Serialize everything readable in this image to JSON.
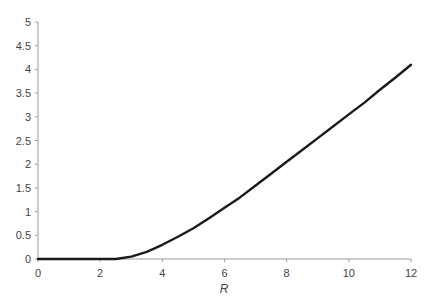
{
  "chart_data": {
    "type": "line",
    "title": "",
    "xlabel": "R",
    "ylabel": "",
    "xlim": [
      0,
      12
    ],
    "ylim": [
      0,
      5
    ],
    "grid": false,
    "legend": null,
    "x_ticks": [
      "0",
      "2",
      "4",
      "6",
      "8",
      "10",
      "12"
    ],
    "y_ticks": [
      "0",
      "0.5",
      "1",
      "1.5",
      "2",
      "2.5",
      "3",
      "3.5",
      "4",
      "4.5",
      "5"
    ],
    "series": [
      {
        "name": "curve",
        "color": "#1a1a1a",
        "x": [
          0,
          1,
          2,
          2.5,
          3,
          3.5,
          4,
          4.5,
          5,
          5.5,
          6,
          6.5,
          7,
          7.5,
          8,
          8.5,
          9,
          9.5,
          10,
          10.5,
          11,
          11.5,
          12
        ],
        "y": [
          0,
          0,
          0,
          0.0,
          0.05,
          0.15,
          0.3,
          0.47,
          0.65,
          0.86,
          1.08,
          1.3,
          1.55,
          1.8,
          2.05,
          2.3,
          2.55,
          2.8,
          3.05,
          3.3,
          3.57,
          3.83,
          4.1
        ]
      }
    ]
  }
}
